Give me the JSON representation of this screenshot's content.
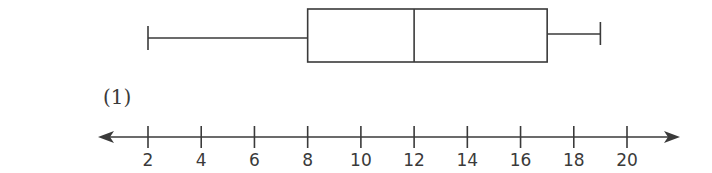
{
  "problem_label": "(1)",
  "colors": {
    "stroke": "#3a3a3a",
    "background": "#ffffff"
  },
  "chart_data": {
    "type": "boxplot",
    "title": "",
    "xlabel": "",
    "ylabel": "",
    "axis": {
      "type": "number-line",
      "arrows": "both",
      "ticks": [
        2,
        4,
        6,
        8,
        10,
        12,
        14,
        16,
        18,
        20
      ],
      "tick_labels": [
        "2",
        "4",
        "6",
        "8",
        "10",
        "12",
        "14",
        "16",
        "18",
        "20"
      ],
      "range": [
        1,
        21
      ]
    },
    "five_number_summary": {
      "min": 2,
      "q1": 8,
      "median": 12,
      "q3": 17,
      "max": 19
    },
    "grid": false,
    "legend": null
  }
}
